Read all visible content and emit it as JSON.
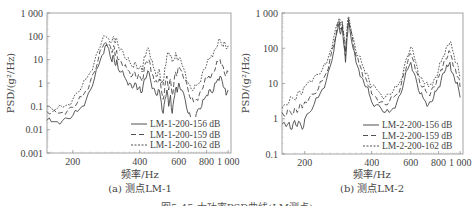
{
  "figure": {
    "caption": "图5-45  大功率PSD曲线(LM测点)"
  },
  "chart_data": [
    {
      "type": "line",
      "id": "a",
      "subcaption": "(a) 测点LM-1",
      "xlabel": "频率/Hz",
      "ylabel": "PSD/(g²/Hz)",
      "xscale": "log",
      "yscale": "log",
      "xlim": [
        153,
        1030
      ],
      "ylim": [
        0.001,
        1000
      ],
      "xticks": [
        200,
        400,
        600,
        800,
        1000
      ],
      "xtick_labels": [
        "200",
        "400",
        "600",
        "800",
        "1 000"
      ],
      "yticks": [
        1000,
        100,
        10,
        1,
        0.1,
        0.01,
        0.001
      ],
      "ytick_labels": [
        "1 000",
        "100",
        "10",
        "1",
        "0.1",
        "0.01",
        "0.001"
      ],
      "grid": false,
      "legend_position": "lower right",
      "series": [
        {
          "name": "LM-1-200-156 dB",
          "style": "solid",
          "x": [
            153,
            160,
            170,
            180,
            190,
            200,
            210,
            220,
            230,
            240,
            250,
            260,
            270,
            280,
            290,
            300,
            305,
            310,
            315,
            320,
            330,
            340,
            350,
            360,
            370,
            380,
            390,
            400,
            410,
            420,
            430,
            440,
            450,
            460,
            470,
            480,
            490,
            500,
            510,
            520,
            530,
            540,
            550,
            560,
            570,
            580,
            590,
            600,
            620,
            640,
            660,
            680,
            700,
            720,
            740,
            760,
            780,
            800,
            820,
            840,
            860,
            880,
            900,
            920,
            940,
            960,
            980,
            1000
          ],
          "y": [
            0.025,
            0.022,
            0.022,
            0.025,
            0.03,
            0.04,
            0.06,
            0.1,
            0.2,
            0.5,
            1.5,
            5,
            15,
            40,
            30,
            8,
            15,
            6,
            10,
            4,
            3,
            2,
            1.2,
            1,
            0.6,
            1,
            0.5,
            0.7,
            0.4,
            1.5,
            2,
            3,
            1,
            0.6,
            0.4,
            0.3,
            0.5,
            0.15,
            0.05,
            0.2,
            0.5,
            0.1,
            0.3,
            0.05,
            0.2,
            0.6,
            0.4,
            1,
            0.5,
            0.2,
            0.05,
            0.03,
            0.03,
            0.05,
            0.08,
            0.1,
            0.2,
            0.3,
            0.5,
            0.4,
            0.5,
            1,
            1.5,
            2,
            1.2,
            0.6,
            0.3,
            0.5
          ]
        },
        {
          "name": "LM-1-200-159 dB",
          "style": "dashed",
          "x": [
            153,
            160,
            170,
            180,
            190,
            200,
            210,
            220,
            230,
            240,
            250,
            260,
            270,
            280,
            290,
            300,
            305,
            310,
            315,
            320,
            330,
            340,
            350,
            360,
            370,
            380,
            390,
            400,
            410,
            420,
            430,
            440,
            450,
            460,
            470,
            480,
            490,
            500,
            510,
            520,
            530,
            540,
            550,
            560,
            570,
            580,
            590,
            600,
            620,
            640,
            660,
            680,
            700,
            720,
            740,
            760,
            780,
            800,
            820,
            840,
            860,
            880,
            900,
            920,
            940,
            960,
            980,
            1000
          ],
          "y": [
            0.06,
            0.05,
            0.05,
            0.055,
            0.07,
            0.09,
            0.15,
            0.25,
            0.5,
            1.2,
            3,
            10,
            30,
            60,
            50,
            20,
            40,
            15,
            25,
            10,
            8,
            5,
            4,
            3,
            2,
            3,
            1.5,
            2,
            1.2,
            5,
            8,
            10,
            3,
            2,
            1.2,
            1,
            1.5,
            0.5,
            0.2,
            0.8,
            2,
            0.5,
            1.5,
            0.3,
            1,
            3,
            2,
            5,
            3,
            1.5,
            0.5,
            0.2,
            0.15,
            0.2,
            0.3,
            0.5,
            1,
            1.5,
            2,
            2,
            3,
            5,
            8,
            10,
            6,
            3,
            2,
            3
          ]
        },
        {
          "name": "LM-1-200-162 dB",
          "style": "dotted",
          "x": [
            153,
            160,
            170,
            180,
            190,
            200,
            210,
            220,
            230,
            240,
            250,
            260,
            270,
            280,
            290,
            300,
            305,
            310,
            315,
            320,
            330,
            340,
            350,
            360,
            370,
            380,
            390,
            400,
            410,
            420,
            430,
            440,
            450,
            460,
            470,
            480,
            490,
            500,
            510,
            520,
            530,
            540,
            550,
            560,
            570,
            580,
            590,
            600,
            620,
            640,
            660,
            680,
            700,
            720,
            740,
            760,
            780,
            800,
            820,
            840,
            860,
            880,
            900,
            920,
            940,
            960,
            980,
            1000
          ],
          "y": [
            0.1,
            0.08,
            0.08,
            0.09,
            0.12,
            0.2,
            0.4,
            0.7,
            1.5,
            3,
            8,
            25,
            60,
            100,
            80,
            60,
            100,
            50,
            80,
            40,
            30,
            15,
            10,
            8,
            5,
            8,
            4,
            5,
            3,
            15,
            25,
            30,
            10,
            5,
            3,
            2,
            4,
            1,
            0.8,
            5,
            15,
            20,
            15,
            8,
            10,
            20,
            10,
            12,
            6,
            3,
            1,
            0.6,
            0.5,
            0.8,
            1,
            2,
            4,
            6,
            10,
            15,
            20,
            30,
            50,
            70,
            40,
            60,
            30,
            40
          ]
        }
      ]
    },
    {
      "type": "line",
      "id": "b",
      "subcaption": "(b) 测点LM-2",
      "xlabel": "频率/Hz",
      "ylabel": "PSD/(g²/Hz)",
      "xscale": "log",
      "yscale": "log",
      "xlim": [
        158,
        1030
      ],
      "ylim": [
        0.1,
        1000
      ],
      "xticks": [
        200,
        400,
        600,
        800,
        1000
      ],
      "xtick_labels": [
        "200",
        "400",
        "600",
        "800",
        "1 000"
      ],
      "yticks": [
        1000,
        100,
        10,
        1,
        0.1
      ],
      "ytick_labels": [
        "1 000",
        "100",
        "10",
        "1",
        "0.1"
      ],
      "grid": false,
      "legend_position": "lower right",
      "series": [
        {
          "name": "LM-2-200-156 dB",
          "style": "solid",
          "x": [
            158,
            165,
            170,
            175,
            180,
            185,
            190,
            195,
            200,
            210,
            220,
            230,
            240,
            250,
            260,
            270,
            280,
            285,
            290,
            295,
            300,
            305,
            310,
            315,
            320,
            330,
            340,
            350,
            360,
            370,
            380,
            390,
            400,
            420,
            440,
            460,
            480,
            500,
            520,
            540,
            560,
            580,
            600,
            620,
            640,
            660,
            680,
            700,
            720,
            740,
            760,
            780,
            800,
            820,
            840,
            860,
            880,
            900,
            920,
            940,
            960,
            980,
            1000
          ],
          "y": [
            0.7,
            0.6,
            0.8,
            0.5,
            0.9,
            0.6,
            0.8,
            0.5,
            1,
            1.5,
            2.5,
            4,
            7,
            12,
            30,
            80,
            300,
            500,
            250,
            400,
            120,
            40,
            200,
            600,
            300,
            100,
            40,
            25,
            15,
            10,
            8,
            5,
            3,
            2.5,
            2,
            1.5,
            1.5,
            2,
            3,
            5,
            12,
            25,
            40,
            20,
            10,
            5,
            4,
            3,
            2.5,
            3,
            4,
            6,
            8,
            12,
            20,
            25,
            30,
            40,
            20,
            15,
            10,
            8,
            4
          ]
        },
        {
          "name": "LM-2-200-159 dB",
          "style": "dashed",
          "x": [
            158,
            165,
            170,
            175,
            180,
            185,
            190,
            195,
            200,
            210,
            220,
            230,
            240,
            250,
            260,
            270,
            280,
            285,
            290,
            295,
            300,
            305,
            310,
            315,
            320,
            330,
            340,
            350,
            360,
            370,
            380,
            390,
            400,
            420,
            440,
            460,
            480,
            500,
            520,
            540,
            560,
            580,
            600,
            620,
            640,
            660,
            680,
            700,
            720,
            740,
            760,
            780,
            800,
            820,
            840,
            860,
            880,
            900,
            920,
            940,
            960,
            980,
            1000
          ],
          "y": [
            1.5,
            1.2,
            1.8,
            1.3,
            2,
            1.5,
            2.5,
            2,
            3,
            4,
            5,
            7,
            12,
            20,
            50,
            120,
            400,
            600,
            350,
            500,
            180,
            60,
            300,
            700,
            400,
            150,
            60,
            40,
            25,
            15,
            12,
            8,
            5,
            4,
            3,
            2.5,
            3,
            4,
            5,
            8,
            20,
            40,
            70,
            40,
            20,
            10,
            8,
            6,
            5,
            6,
            8,
            10,
            15,
            25,
            35,
            50,
            60,
            80,
            50,
            30,
            20,
            15,
            8
          ]
        },
        {
          "name": "LM-2-200-162 dB",
          "style": "dotted",
          "x": [
            158,
            165,
            170,
            175,
            180,
            185,
            190,
            195,
            200,
            210,
            220,
            230,
            240,
            250,
            260,
            270,
            280,
            285,
            290,
            295,
            300,
            305,
            310,
            315,
            320,
            330,
            340,
            350,
            360,
            370,
            380,
            390,
            400,
            420,
            440,
            460,
            480,
            500,
            520,
            540,
            560,
            580,
            600,
            620,
            640,
            660,
            680,
            700,
            720,
            740,
            760,
            780,
            800,
            820,
            840,
            860,
            880,
            900,
            920,
            940,
            960,
            980,
            1000
          ],
          "y": [
            2,
            2.5,
            3,
            4,
            3.5,
            5,
            6,
            5,
            8,
            12,
            15,
            18,
            25,
            35,
            80,
            200,
            500,
            700,
            450,
            600,
            250,
            80,
            400,
            800,
            500,
            200,
            80,
            60,
            40,
            25,
            20,
            12,
            8,
            7,
            5,
            4,
            5,
            6,
            8,
            12,
            30,
            60,
            110,
            60,
            30,
            15,
            12,
            10,
            8,
            10,
            12,
            15,
            25,
            40,
            60,
            90,
            120,
            150,
            100,
            60,
            40,
            30,
            15
          ]
        }
      ]
    }
  ]
}
